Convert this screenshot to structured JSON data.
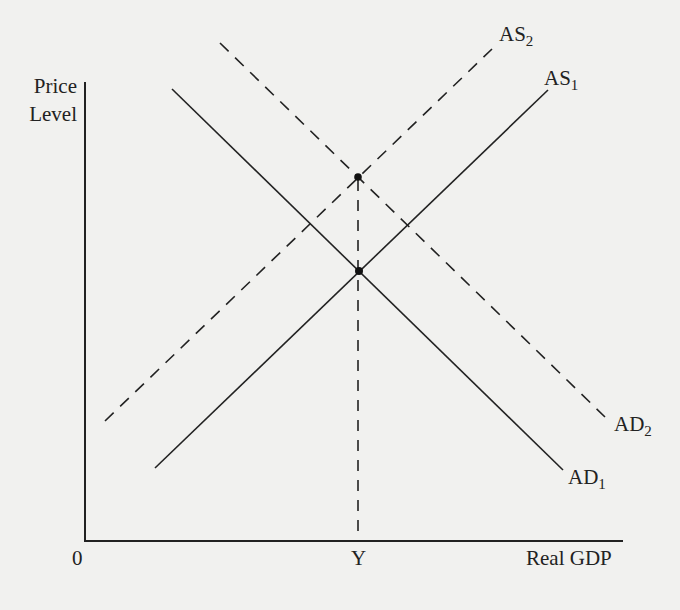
{
  "diagram": {
    "title": "",
    "axes": {
      "y_label_line1": "Price",
      "y_label_line2": "Level",
      "x_label": "Real GDP",
      "origin_label": "0",
      "x_tick_label": "Y"
    },
    "curves": [
      {
        "id": "AS1",
        "base": "AS",
        "sub": "1",
        "style": "solid"
      },
      {
        "id": "AS2",
        "base": "AS",
        "sub": "2",
        "style": "dashed"
      },
      {
        "id": "AD1",
        "base": "AD",
        "sub": "1",
        "style": "solid"
      },
      {
        "id": "AD2",
        "base": "AD",
        "sub": "2",
        "style": "dashed"
      }
    ],
    "points": [
      {
        "name": "equilibrium-1",
        "description": "AS1 ∩ AD1 at output Y"
      },
      {
        "name": "equilibrium-2",
        "description": "AS2 ∩ AD2 at output Y, higher price level"
      }
    ],
    "colors": {
      "ink": "#222222",
      "paper": "#f1f1ef"
    }
  }
}
